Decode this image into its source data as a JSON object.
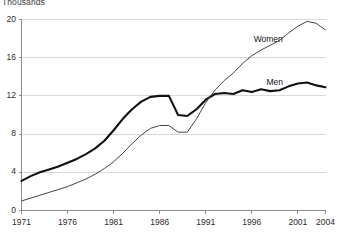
{
  "chart_data": {
    "type": "line",
    "title": "",
    "subtitle": "",
    "xlabel": "",
    "ylabel": "Thousands",
    "xlim": [
      1971,
      2004
    ],
    "ylim": [
      0,
      20
    ],
    "yticks": [
      0,
      4,
      8,
      12,
      16,
      20
    ],
    "xticks": [
      1971,
      1976,
      1981,
      1986,
      1991,
      1996,
      2001,
      2004
    ],
    "grid": "horizontal",
    "legend_position": "inline-annotations",
    "x": [
      1971,
      1972,
      1973,
      1974,
      1975,
      1976,
      1977,
      1978,
      1979,
      1980,
      1981,
      1982,
      1983,
      1984,
      1985,
      1986,
      1987,
      1988,
      1989,
      1990,
      1991,
      1992,
      1993,
      1994,
      1995,
      1996,
      1997,
      1998,
      1999,
      2000,
      2001,
      2002,
      2003,
      2004
    ],
    "series": [
      {
        "name": "Men",
        "color": "#111111",
        "line_width": 2.1,
        "values": [
          3.1,
          3.6,
          4.0,
          4.3,
          4.6,
          5.0,
          5.4,
          5.9,
          6.5,
          7.3,
          8.4,
          9.6,
          10.6,
          11.4,
          11.9,
          12.0,
          12.0,
          10.0,
          9.9,
          10.6,
          11.6,
          12.2,
          12.3,
          12.2,
          12.6,
          12.4,
          12.7,
          12.5,
          12.6,
          13.0,
          13.3,
          13.4,
          13.1,
          12.9
        ]
      },
      {
        "name": "Women",
        "color": "#444444",
        "line_width": 1.0,
        "values": [
          1.0,
          1.3,
          1.6,
          1.9,
          2.2,
          2.5,
          2.9,
          3.3,
          3.8,
          4.4,
          5.1,
          6.0,
          7.0,
          7.9,
          8.6,
          8.9,
          8.9,
          8.2,
          8.2,
          9.6,
          11.3,
          12.6,
          13.6,
          14.4,
          15.4,
          16.2,
          16.8,
          17.3,
          17.8,
          18.6,
          19.3,
          19.8,
          19.6,
          18.9
        ]
      }
    ],
    "annotations": [
      {
        "text": "Women",
        "x": 1996.2,
        "y": 17.9
      },
      {
        "text": "Men",
        "x": 1997.6,
        "y": 13.4
      }
    ]
  }
}
